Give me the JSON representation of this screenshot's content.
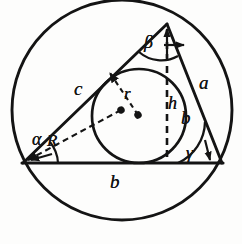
{
  "figure": {
    "type": "geometry-diagram",
    "ink_color": "#141414",
    "background_color": "#fdfdfc",
    "labels": {
      "side_a": "a",
      "side_b_base": "b",
      "side_b_mid": "b",
      "side_c": "c",
      "height_h": "h",
      "inradius_r": "r",
      "circumradius_R": "R",
      "angle_alpha": "α",
      "angle_beta": "β",
      "angle_gamma": "γ"
    },
    "geometry": {
      "circumcircle": {
        "cx": 122,
        "cy": 110,
        "r": 110
      },
      "incircle": {
        "cx": 139,
        "cy": 116,
        "r": 47
      },
      "triangle": {
        "vertex_left": {
          "x": 23,
          "y": 163
        },
        "vertex_right": {
          "x": 222,
          "y": 163
        },
        "vertex_apex": {
          "x": 167,
          "y": 24
        }
      },
      "height_line": {
        "x1": 167,
        "y1": 24,
        "x2": 167,
        "y2": 163
      },
      "inradius_line": {
        "x1": 139,
        "y1": 116,
        "x2": 108,
        "y2": 72
      },
      "circumradius_line": {
        "x1": 122,
        "y1": 110,
        "x2": 25,
        "y2": 161
      }
    }
  }
}
